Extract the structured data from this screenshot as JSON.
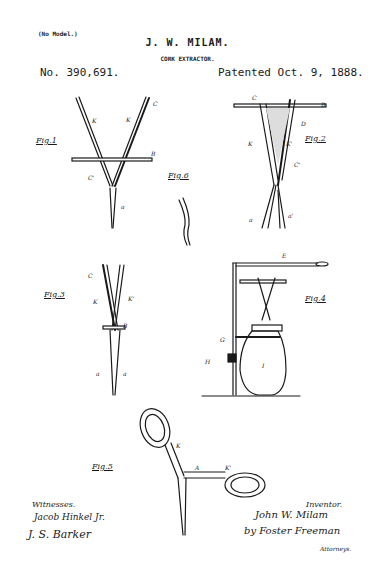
{
  "header": {
    "model_note": "(No Model.)",
    "inventor_name": "J. W. MILAM.",
    "title": "CORK EXTRACTOR.",
    "patent_number": "No. 390,691.",
    "patent_date": "Patented Oct. 9, 1888."
  },
  "figures": {
    "fig1": {
      "label": "Fig.1",
      "letters": [
        "C",
        "K",
        "K",
        "B",
        "C'",
        "a"
      ]
    },
    "fig2": {
      "label": "Fig.2",
      "letters": [
        "C",
        "B",
        "D",
        "K",
        "K'",
        "C'",
        "a",
        "a'"
      ]
    },
    "fig3": {
      "label": "Fig.3",
      "letters": [
        "C",
        "K",
        "K'",
        "B",
        "a",
        "a"
      ]
    },
    "fig4": {
      "label": "Fig.4",
      "letters": [
        "E",
        "C",
        "B",
        "K",
        "K'",
        "c'",
        "F",
        "a",
        "a'",
        "G",
        "G'",
        "h",
        "H",
        "I",
        "J"
      ]
    },
    "fig5": {
      "label": "Fig.5",
      "letters": [
        "X",
        "K",
        "A",
        "K'",
        "X",
        "a"
      ]
    },
    "fig6": {
      "label": "Fig.6",
      "letters": [
        "a"
      ]
    }
  },
  "signatures": {
    "witnesses_label": "Witnesses.",
    "witness_1": "Jacob Hinkel Jr.",
    "witness_2": "J. S. Barker",
    "inventor_label": "Inventor.",
    "inventor_signature": "John W. Milam",
    "attorney_signature": "by Foster Freeman",
    "attorney_label": "Attorneys."
  }
}
